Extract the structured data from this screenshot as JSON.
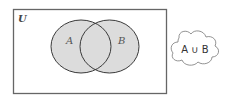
{
  "diagram": {
    "universe_label": "U",
    "set_a_label": "A",
    "set_b_label": "B",
    "shaded_region": "A ∪ B",
    "cloud_label": "A ∪ B",
    "colors": {
      "fill": "#dcdcdc",
      "outline": "#3a3a3a",
      "frame": "#666666",
      "label": "#555555"
    }
  }
}
